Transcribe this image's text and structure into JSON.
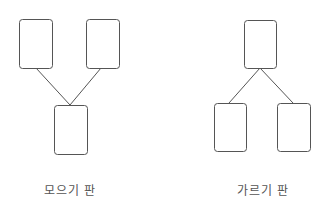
{
  "diagrams": [
    {
      "label": "모으기 판",
      "type": "merge",
      "boxes": [
        {
          "x": 19,
          "y": 19,
          "w": 33,
          "h": 49
        },
        {
          "x": 86,
          "y": 19,
          "w": 33,
          "h": 49
        },
        {
          "x": 54,
          "y": 105,
          "w": 33,
          "h": 49
        }
      ],
      "lines": [
        {
          "x1": 36,
          "y1": 68,
          "x2": 70,
          "y2": 105
        },
        {
          "x1": 101,
          "y1": 68,
          "x2": 70,
          "y2": 105
        }
      ]
    },
    {
      "label": "가르기 판",
      "type": "split",
      "boxes": [
        {
          "x": 244,
          "y": 20,
          "w": 32,
          "h": 48
        },
        {
          "x": 214,
          "y": 103,
          "w": 32,
          "h": 48
        },
        {
          "x": 277,
          "y": 103,
          "w": 33,
          "h": 48
        }
      ],
      "lines": [
        {
          "x1": 260,
          "y1": 68,
          "x2": 229,
          "y2": 103
        },
        {
          "x1": 260,
          "y1": 68,
          "x2": 293,
          "y2": 103
        }
      ]
    }
  ],
  "colors": {
    "stroke": "#555555",
    "background": "#ffffff"
  }
}
